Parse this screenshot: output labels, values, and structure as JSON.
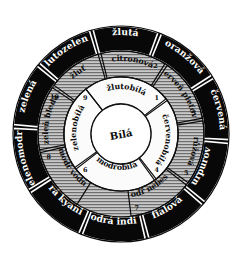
{
  "diagram": {
    "language": "cs",
    "center": {
      "label": "Bílá"
    },
    "rings": {
      "outer": {
        "name": "outer-ring",
        "fill": "#080808",
        "text_color": "#ffffff",
        "segments": [
          {
            "label": "žlutá",
            "start": -105,
            "end": -70
          },
          {
            "label": "oranžová",
            "start": -68,
            "end": -33
          },
          {
            "label": "červená",
            "start": -31,
            "end": 3
          },
          {
            "label": "purpurová",
            "start": 5,
            "end": 39
          },
          {
            "label": "fialová",
            "start": 41,
            "end": 75
          },
          {
            "label": "modrá indigo",
            "start": 77,
            "end": 111
          },
          {
            "label": "modrá kyanitová",
            "start": 113,
            "end": 147
          },
          {
            "label": "zelenomodrá",
            "start": 149,
            "end": 183
          },
          {
            "label": "zelená",
            "start": 185,
            "end": 219
          },
          {
            "label": "žlutozelená",
            "start": 221,
            "end": 253
          }
        ]
      },
      "middle": {
        "name": "middle-ring",
        "fill": "#b9b9b9",
        "text_color": "#0a0a0a",
        "segments": [
          {
            "label": "citronová",
            "number": "2",
            "start": -104,
            "end": -58
          },
          {
            "label": "červeň pleťová",
            "number": "3",
            "start": -56,
            "end": -11
          },
          {
            "label": "růžová",
            "number": "5",
            "start": -9,
            "end": 36
          },
          {
            "label": "modř nebeská",
            "number": "7",
            "start": 38,
            "end": 83
          },
          {
            "label": "modř vodní",
            "number": "8",
            "start": 122,
            "end": 167
          },
          {
            "label": "zeleň bledá",
            "number": "10",
            "start": 169,
            "end": 214
          },
          {
            "label": "žluť",
            "number": "",
            "start": 216,
            "end": 254
          }
        ]
      },
      "inner": {
        "name": "inner-ring",
        "fill": "#fbfbfb",
        "text_color": "#0a0a0a",
        "segments": [
          {
            "label": "žlutobílá",
            "number": "1",
            "start": -128,
            "end": -38
          },
          {
            "label": "červenobílá",
            "number": "4",
            "start": -36,
            "end": 52
          },
          {
            "label": "modrobílá",
            "number": "6",
            "start": 54,
            "end": 142
          },
          {
            "label": "zelenobílá",
            "number": "9",
            "start": 144,
            "end": 232
          }
        ]
      }
    },
    "geometry": {
      "cx": 121,
      "cy": 134,
      "r_outer": 108,
      "r_mid": 83,
      "r_inner": 57,
      "r_core": 30
    }
  }
}
